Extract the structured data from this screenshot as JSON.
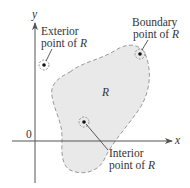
{
  "diagram": {
    "axes": {
      "x_label": "x",
      "y_label": "y",
      "origin_label": "0"
    },
    "region": {
      "label": "R",
      "fill": "#e9e9e9",
      "border": "#999999"
    },
    "points": {
      "exterior": {
        "line1": "Exterior",
        "line2": "point of ",
        "var": "R"
      },
      "boundary": {
        "line1": "Boundary",
        "line2": "point of ",
        "var": "R"
      },
      "interior": {
        "line1": "Interior",
        "line2": "point of ",
        "var": "R"
      }
    },
    "colors": {
      "axis": "#555555",
      "text": "#333333",
      "point": "#111111"
    }
  }
}
